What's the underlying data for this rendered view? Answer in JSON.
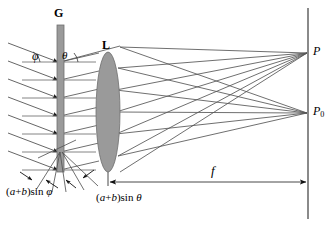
{
  "figure": {
    "kind": "optics-ray-diagram",
    "title_visible": false,
    "width": 331,
    "height": 227,
    "background": "#ffffff"
  },
  "colors": {
    "ray": "#555555",
    "element_fill": "#9a9a9a",
    "element_stroke": "#707070",
    "screen": "#888888",
    "label": "#000000",
    "arrow": "#111111"
  },
  "labels": {
    "grating": "G",
    "lens": "L",
    "angle_incidence": "φ",
    "angle_diffraction": "θ",
    "focus_point": "P",
    "focus_point_zero": "P",
    "focus_point_zero_sub": "0",
    "focal_length": "f",
    "path_difference_incidence_pre": "(",
    "path_difference_incidence_a": "a",
    "path_difference_incidence_plus": "+",
    "path_difference_incidence_b": "b",
    "path_difference_incidence_post": ")sin ",
    "path_difference_incidence_angle": "φ",
    "path_difference_diffraction_angle": "θ"
  },
  "elements": {
    "grating": {
      "name": "diffraction-grating",
      "x": 57,
      "y_top": 25,
      "y_bottom": 172,
      "width": 7
    },
    "lens": {
      "name": "converging-lens",
      "cx": 108,
      "cy": 112,
      "rx": 12,
      "ry": 60
    },
    "screen": {
      "name": "observation-screen",
      "x": 308,
      "y_top": 8,
      "y_bottom": 219
    }
  },
  "geometry": {
    "incoming_ray_count": 7,
    "incoming_ray_angle_deg": 30,
    "grating_line_ys": [
      62,
      80,
      98,
      116,
      134,
      152,
      170
    ],
    "focus_P_y": 53,
    "focus_P0_y": 113,
    "focal_line_y": 182,
    "focal_line_x_start": 108,
    "focal_line_x_end": 307
  }
}
